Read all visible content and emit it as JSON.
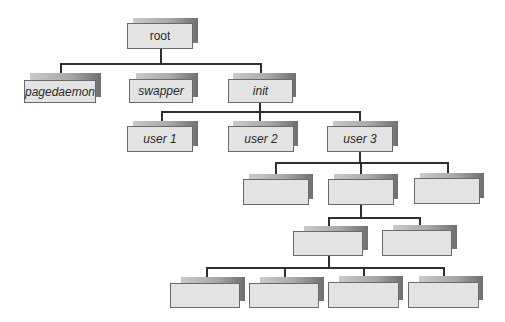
{
  "diagram": {
    "type": "process-tree",
    "colors": {
      "box_fill": "#e3e3e3",
      "box_border": "#6a6a6a",
      "connector": "#2e2e2e",
      "shadow_dark": "#6f6f6f",
      "shadow_light": "#c9c9c9"
    },
    "nodes": {
      "root": {
        "label": "root"
      },
      "pagedaemon": {
        "label": "pagedaemon"
      },
      "swapper": {
        "label": "swapper"
      },
      "init": {
        "label": "init"
      },
      "user1": {
        "label": "user 1"
      },
      "user2": {
        "label": "user 2"
      },
      "user3": {
        "label": "user 3"
      },
      "l3a": {
        "label": ""
      },
      "l3b": {
        "label": ""
      },
      "l3c": {
        "label": ""
      },
      "l4a": {
        "label": ""
      },
      "l4b": {
        "label": ""
      },
      "l5a": {
        "label": ""
      },
      "l5b": {
        "label": ""
      },
      "l5c": {
        "label": ""
      },
      "l5d": {
        "label": ""
      }
    },
    "edges": [
      [
        "root",
        "pagedaemon"
      ],
      [
        "root",
        "swapper"
      ],
      [
        "root",
        "init"
      ],
      [
        "init",
        "user1"
      ],
      [
        "init",
        "user2"
      ],
      [
        "init",
        "user3"
      ],
      [
        "user3",
        "l3a"
      ],
      [
        "user3",
        "l3b"
      ],
      [
        "user3",
        "l3c"
      ],
      [
        "l3b",
        "l4a"
      ],
      [
        "l3b",
        "l4b"
      ],
      [
        "l4a",
        "l5a"
      ],
      [
        "l4a",
        "l5b"
      ],
      [
        "l4a",
        "l5c"
      ],
      [
        "l4a",
        "l5d"
      ]
    ]
  }
}
